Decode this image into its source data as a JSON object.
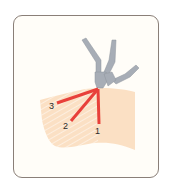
{
  "figure": {
    "type": "injection-angle-diagram",
    "colors": {
      "frame_border": "#8a7f78",
      "frame_fill": "#fffdf8",
      "skin": "#fbe0c4",
      "skin_hatch": "#ffffff",
      "needle_path": "#e8403a",
      "instrument": "#a7adb6"
    },
    "labels": {
      "path1": "1",
      "path2": "2",
      "path3": "3"
    }
  }
}
